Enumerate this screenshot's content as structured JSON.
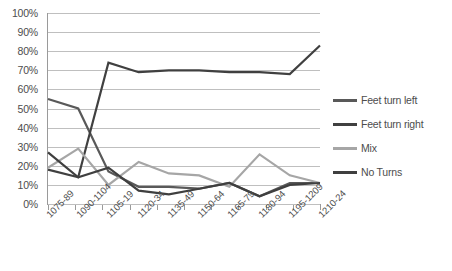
{
  "chart_data": {
    "type": "line",
    "title": "",
    "xlabel": "",
    "ylabel": "",
    "ylim": [
      0,
      100
    ],
    "y_tick_labels": [
      "0%",
      "10%",
      "20%",
      "30%",
      "40%",
      "50%",
      "60%",
      "70%",
      "80%",
      "90%",
      "100%"
    ],
    "y_ticks": [
      0,
      10,
      20,
      30,
      40,
      50,
      60,
      70,
      80,
      90,
      100
    ],
    "grid": true,
    "legend_position": "right",
    "categories": [
      "1075-89",
      "1090-1104",
      "1105-19",
      "1120-34",
      "1135-49",
      "1150-64",
      "1165-79",
      "1180-94",
      "1195-1209",
      "1210-24"
    ],
    "series": [
      {
        "name": "Feet turn left",
        "color": "#595959",
        "values": [
          55,
          50,
          17,
          9,
          9,
          8,
          11,
          4,
          11,
          11
        ]
      },
      {
        "name": "Feet turn right",
        "color": "#404040",
        "values": [
          18,
          14,
          74,
          69,
          70,
          70,
          69,
          69,
          68,
          83
        ]
      },
      {
        "name": "Mix",
        "color": "#a6a6a6",
        "values": [
          19,
          29,
          10,
          22,
          16,
          15,
          9,
          26,
          15,
          11
        ]
      },
      {
        "name": "No Turns",
        "color": "#3f3f3f",
        "values": [
          27,
          14,
          19,
          7,
          5,
          8,
          11,
          4,
          10,
          11
        ]
      }
    ]
  },
  "legend": {
    "items": [
      {
        "label": "Feet turn left",
        "color": "#595959"
      },
      {
        "label": "Feet turn right",
        "color": "#404040"
      },
      {
        "label": "Mix",
        "color": "#a6a6a6"
      },
      {
        "label": "No Turns",
        "color": "#3f3f3f"
      }
    ]
  }
}
